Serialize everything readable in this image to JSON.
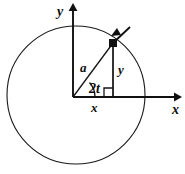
{
  "figure": {
    "background_color": "#ffffff",
    "stroke_color": "#101010",
    "width": 185,
    "height": 174
  },
  "axes": {
    "x_label": "x",
    "y_label": "y",
    "origin": {
      "x": 73,
      "y": 97
    },
    "x_axis_end": {
      "x": 178,
      "y": 97
    },
    "y_axis_end": {
      "x": 73,
      "y": 5
    }
  },
  "circle": {
    "center_x": 76,
    "center_y": 95,
    "radius": 69
  },
  "point": {
    "marker": "filled-square",
    "x": 113,
    "y": 43
  },
  "labels": {
    "radius": "a",
    "angle": "2t",
    "vertical_leg": "y",
    "horizontal_leg": "x"
  },
  "annotations": {
    "right_angle_marker": true,
    "direction_arrow": "counterclockwise-tangent"
  },
  "caption": ""
}
